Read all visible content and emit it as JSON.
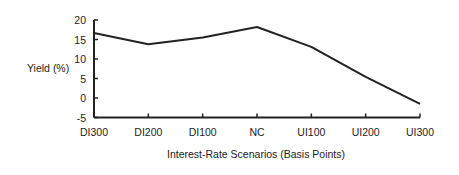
{
  "chart_data": {
    "type": "line",
    "title": "",
    "xlabel": "Interest-Rate Scenarios (Basis Points)",
    "ylabel": "Yield (%)",
    "categories": [
      "DI300",
      "DI200",
      "DI100",
      "NC",
      "UI100",
      "UI200",
      "UI300"
    ],
    "series": [
      {
        "name": "Yield",
        "values": [
          16.7,
          13.8,
          15.5,
          18.2,
          13.1,
          5.4,
          -1.5
        ]
      }
    ],
    "yticks": [
      20,
      15,
      10,
      5,
      0,
      -5
    ],
    "ylim": [
      -5,
      20
    ],
    "grid": false,
    "legend": null
  },
  "style": {
    "line_color": "#222222",
    "axis_color": "#222222"
  }
}
